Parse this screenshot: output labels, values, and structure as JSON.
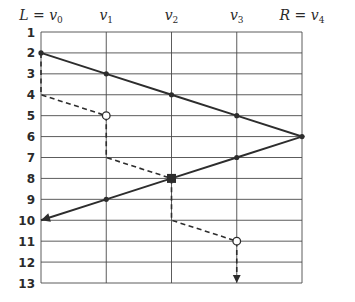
{
  "diagram": {
    "columns": [
      {
        "id": "v0",
        "label": "L = v",
        "sub": "0"
      },
      {
        "id": "v1",
        "label": "v",
        "sub": "1"
      },
      {
        "id": "v2",
        "label": "v",
        "sub": "2"
      },
      {
        "id": "v3",
        "label": "v",
        "sub": "3"
      },
      {
        "id": "v4",
        "label": "R = v",
        "sub": "4"
      }
    ],
    "rows": [
      "1",
      "2",
      "3",
      "4",
      "5",
      "6",
      "7",
      "8",
      "9",
      "10",
      "11",
      "12",
      "13"
    ],
    "solid_path": {
      "points": [
        {
          "col": 0,
          "row": 2
        },
        {
          "col": 1,
          "row": 3
        },
        {
          "col": 2,
          "row": 4
        },
        {
          "col": 3,
          "row": 5
        },
        {
          "col": 4,
          "row": 6
        },
        {
          "col": 3,
          "row": 7
        },
        {
          "col": 2,
          "row": 8
        },
        {
          "col": 1,
          "row": 9
        },
        {
          "col": 0,
          "row": 10
        }
      ],
      "end_marker": "arrow",
      "color": "#2d2d2d"
    },
    "dashed_path": {
      "points": [
        {
          "col": 0,
          "row": 2
        },
        {
          "col": 0,
          "row": 4
        },
        {
          "col": 1,
          "row": 5
        },
        {
          "col": 1,
          "row": 7
        },
        {
          "col": 2,
          "row": 8
        },
        {
          "col": 2,
          "row": 10
        },
        {
          "col": 3,
          "row": 11
        },
        {
          "col": 3,
          "row": 13
        }
      ],
      "end_marker": "arrow",
      "color": "#2d2d2d"
    },
    "open_nodes": [
      {
        "col": 1,
        "row": 5
      },
      {
        "col": 3,
        "row": 11
      }
    ],
    "square_nodes": [
      {
        "col": 2,
        "row": 8
      }
    ]
  }
}
